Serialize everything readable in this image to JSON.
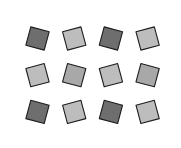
{
  "figure": {
    "tile_types": [
      "square",
      "triangle"
    ],
    "palette": {
      "square_dark": "#6e6e6e",
      "square_medium": "#a8a8a8",
      "square_light": "#bdbdbd",
      "triangle_dark": "#8f8f8f",
      "triangle_medium": "#b0b0b0",
      "triangle_light": "#dcdcdc",
      "edge": "#1c1c1c",
      "background": "#ffffff"
    }
  }
}
